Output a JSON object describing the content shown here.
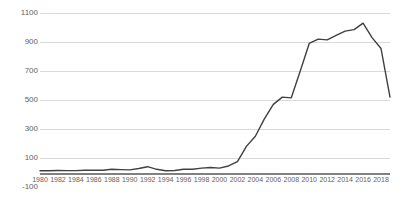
{
  "chart": {
    "title": "",
    "title_note": "title row clipped at top edge of screenshot",
    "line_color": "#404040",
    "gridline_color": "#d9d9d9",
    "axis_color": "#808080",
    "label_color": "#636363"
  },
  "chart_data": {
    "type": "line",
    "title": "",
    "xlabel": "",
    "ylabel": "",
    "ylim": [
      -100,
      1100
    ],
    "ytick_values": [
      -100,
      100,
      300,
      500,
      700,
      900,
      1100
    ],
    "ytick_labels": [
      "-100",
      "100",
      "300",
      "500",
      "700",
      "900",
      "1100"
    ],
    "grid": true,
    "legend": false,
    "xlim": [
      1980,
      2019
    ],
    "xtick_labels": [
      "1980",
      "1982",
      "1984",
      "1986",
      "1988",
      "1990",
      "1992",
      "1994",
      "1996",
      "1998",
      "2000",
      "2002",
      "2004",
      "2006",
      "2008",
      "2010",
      "2012",
      "2014",
      "2016",
      "2018"
    ],
    "xtick_values": [
      1980,
      1982,
      1984,
      1986,
      1988,
      1990,
      1992,
      1994,
      1996,
      1998,
      2000,
      2002,
      2004,
      2006,
      2008,
      2010,
      2012,
      2014,
      2016,
      2018
    ],
    "x": [
      1980,
      1981,
      1982,
      1983,
      1984,
      1985,
      1986,
      1987,
      1988,
      1989,
      1990,
      1991,
      1992,
      1993,
      1994,
      1995,
      1996,
      1997,
      1998,
      1999,
      2000,
      2001,
      2002,
      2003,
      2004,
      2005,
      2006,
      2007,
      2008,
      2009,
      2010,
      2011,
      2012,
      2013,
      2014,
      2015,
      2016,
      2017,
      2018,
      2019
    ],
    "values": [
      12,
      12,
      14,
      13,
      13,
      16,
      16,
      15,
      22,
      20,
      18,
      28,
      40,
      22,
      12,
      14,
      22,
      22,
      30,
      34,
      30,
      45,
      75,
      180,
      250,
      370,
      470,
      520,
      515,
      700,
      890,
      920,
      915,
      945,
      975,
      985,
      1030,
      930,
      855,
      520
    ],
    "series": [
      {
        "name": "",
        "values": [
          12,
          12,
          14,
          13,
          13,
          16,
          16,
          15,
          22,
          20,
          18,
          28,
          40,
          22,
          12,
          14,
          22,
          22,
          30,
          34,
          30,
          45,
          75,
          180,
          250,
          370,
          470,
          520,
          515,
          700,
          890,
          920,
          915,
          945,
          975,
          985,
          1030,
          930,
          855,
          520
        ]
      }
    ]
  }
}
